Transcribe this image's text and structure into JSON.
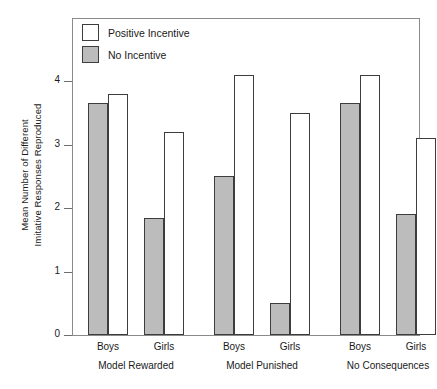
{
  "chart_data": {
    "type": "bar",
    "title": "",
    "subtitle": "",
    "xlabel": "",
    "ylabel": "Mean Number of Different Imitative Responses Reproduced",
    "ylabel_lines": [
      "Mean Number of Different",
      "Imitative Responses Reproduced"
    ],
    "ylim": [
      0,
      4.55
    ],
    "ytick_values": [
      0,
      1,
      2,
      3,
      4
    ],
    "ytick_labels": [
      "0",
      "1",
      "2",
      "3",
      "4"
    ],
    "grid": false,
    "legend_position": "top-left",
    "categories": [
      "Boys",
      "Girls",
      "Boys",
      "Girls",
      "Boys",
      "Girls"
    ],
    "groups": [
      {
        "label": "Model Rewarded",
        "subgroups": [
          {
            "label": "Boys",
            "no_incentive": 3.65,
            "positive_incentive": 3.8
          },
          {
            "label": "Girls",
            "no_incentive": 1.85,
            "positive_incentive": 3.2
          }
        ]
      },
      {
        "label": "Model Punished",
        "subgroups": [
          {
            "label": "Boys",
            "no_incentive": 2.5,
            "positive_incentive": 4.1
          },
          {
            "label": "Girls",
            "no_incentive": 0.5,
            "positive_incentive": 3.5
          }
        ]
      },
      {
        "label": "No Consequences",
        "subgroups": [
          {
            "label": "Boys",
            "no_incentive": 3.65,
            "positive_incentive": 4.1
          },
          {
            "label": "Girls",
            "no_incentive": 1.9,
            "positive_incentive": 3.1
          }
        ]
      }
    ],
    "series": [
      {
        "name": "No Incentive",
        "values": [
          3.65,
          1.85,
          2.5,
          0.5,
          3.65,
          1.9
        ],
        "color": "#bcbcbc"
      },
      {
        "name": "Positive Incentive",
        "values": [
          3.8,
          3.2,
          4.1,
          3.5,
          4.1,
          3.1
        ],
        "color": "#ffffff"
      }
    ]
  },
  "legend": {
    "items": [
      {
        "label": "Positive Incentive",
        "swatch": "white"
      },
      {
        "label": "No Incentive",
        "swatch": "gray"
      }
    ]
  },
  "colors": {
    "bar_gray": "#bcbcbc",
    "bar_white": "#ffffff",
    "bar_outline": "#3d3d3d",
    "frame": "#8a8a8a",
    "text": "#1a1a1a",
    "background": "#ffffff"
  }
}
